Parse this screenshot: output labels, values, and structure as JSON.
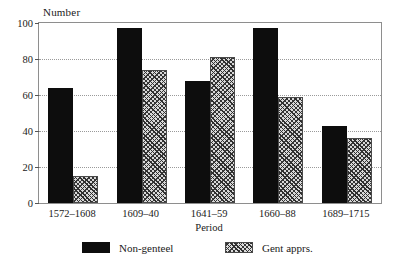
{
  "chart_data": {
    "type": "bar",
    "title": "",
    "subtitle": "",
    "xlabel": "Period",
    "ylabel": "Number",
    "ylim": [
      0,
      100
    ],
    "yticks": [
      0,
      20,
      40,
      60,
      80,
      100
    ],
    "ytick_labels": [
      "0",
      "20",
      "40",
      "60",
      "80",
      "100"
    ],
    "gridlines": [
      20,
      40,
      60,
      80
    ],
    "grid": true,
    "grid_style": "dotted-horizontal",
    "legend_position": "below-axis",
    "categories": [
      "1572–1608",
      "1609–40",
      "1641–59",
      "1660–88",
      "1689–1715"
    ],
    "series": [
      {
        "name": "Non-genteel",
        "fill": "solid-black",
        "color": "#0d0d0d",
        "values": [
          64,
          97,
          68,
          97,
          43
        ]
      },
      {
        "name": "Gent apprs.",
        "fill": "hatched-grey",
        "color": "#d8d8d8",
        "values": [
          15,
          74,
          81,
          59,
          36
        ]
      }
    ]
  },
  "axes": {
    "y_title": "Number",
    "x_title": "Period"
  },
  "legend": {
    "entries": [
      {
        "label": "Non-genteel",
        "swatch": "solid-swatch"
      },
      {
        "label": "Gent apprs.",
        "swatch": "hatched-swatch"
      }
    ]
  },
  "colors": {
    "series_1": "#0d0d0d",
    "series_2": "#d8d8d8",
    "frame": "#8e8e8e",
    "gridline": "#9a9a9a",
    "background": "#ffffff",
    "text": "#1a1a1a"
  }
}
